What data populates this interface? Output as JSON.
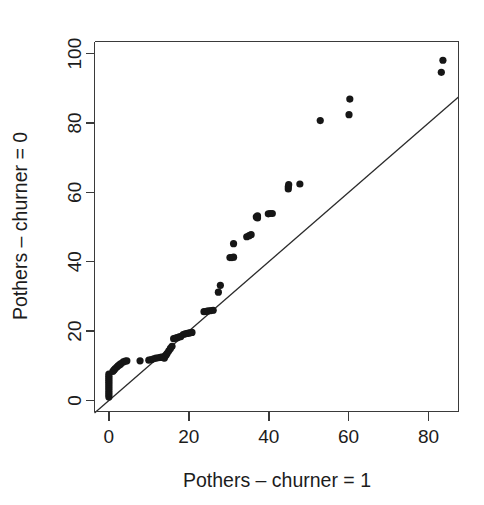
{
  "figure": {
    "kind": "qq-plot",
    "background_color": "#ffffff",
    "foreground_color": "#161616",
    "width": 484,
    "height": 505
  },
  "chart_data": {
    "type": "scatter",
    "title": "",
    "subtitle": "",
    "xlabel": "Pothers – churner = 1",
    "ylabel": "Pothers – churner = 0",
    "xlim": [
      -3.6,
      87.5
    ],
    "ylim": [
      -3.2,
      103.5
    ],
    "xticks": [
      0,
      20,
      40,
      60,
      80
    ],
    "xtick_labels": [
      "0",
      "20",
      "40",
      "60",
      "80"
    ],
    "yticks": [
      0,
      20,
      40,
      60,
      80,
      100
    ],
    "ytick_labels": [
      "0",
      "20",
      "40",
      "60",
      "80",
      "100"
    ],
    "grid": false,
    "legend": null,
    "legend_position": "none",
    "annotations": [],
    "point_color": "#161616",
    "point_radius_px": 3.6,
    "reference_line": {
      "label": "y = x identity line",
      "type": "line",
      "slope": 1,
      "intercept": 0,
      "color": "#2b2b2b",
      "x_start": -3.6,
      "x_end": 87.5
    },
    "series": [
      {
        "name": "quantile pairs",
        "marker": "filled-circle",
        "points": [
          [
            0.0,
            1.0
          ],
          [
            0.0,
            1.6
          ],
          [
            0.0,
            2.2
          ],
          [
            0.0,
            2.8
          ],
          [
            0.0,
            3.4
          ],
          [
            0.0,
            4.0
          ],
          [
            0.0,
            4.6
          ],
          [
            0.0,
            5.2
          ],
          [
            0.0,
            5.8
          ],
          [
            0.0,
            6.4
          ],
          [
            0.0,
            7.0
          ],
          [
            0.0,
            7.6
          ],
          [
            1.0,
            8.4
          ],
          [
            1.3,
            8.8
          ],
          [
            1.6,
            9.2
          ],
          [
            2.0,
            9.6
          ],
          [
            2.3,
            10.0
          ],
          [
            2.7,
            10.3
          ],
          [
            3.0,
            10.6
          ],
          [
            3.6,
            11.1
          ],
          [
            4.1,
            11.3
          ],
          [
            4.5,
            11.4
          ],
          [
            7.8,
            11.4
          ],
          [
            10.0,
            11.6
          ],
          [
            10.6,
            11.8
          ],
          [
            11.2,
            12.0
          ],
          [
            11.8,
            12.2
          ],
          [
            12.4,
            12.3
          ],
          [
            12.9,
            12.4
          ],
          [
            13.3,
            12.5
          ],
          [
            13.6,
            12.3
          ],
          [
            13.9,
            12.2
          ],
          [
            14.3,
            13.0
          ],
          [
            14.6,
            13.6
          ],
          [
            15.0,
            14.3
          ],
          [
            15.4,
            15.0
          ],
          [
            15.8,
            15.6
          ],
          [
            16.2,
            17.8
          ],
          [
            16.7,
            18.0
          ],
          [
            17.1,
            18.1
          ],
          [
            17.6,
            18.3
          ],
          [
            18.0,
            18.4
          ],
          [
            18.6,
            19.0
          ],
          [
            19.1,
            19.2
          ],
          [
            19.5,
            19.3
          ],
          [
            19.9,
            19.4
          ],
          [
            20.3,
            19.5
          ],
          [
            20.8,
            19.6
          ],
          [
            23.8,
            25.6
          ],
          [
            24.4,
            25.7
          ],
          [
            24.9,
            25.8
          ],
          [
            25.6,
            25.9
          ],
          [
            26.1,
            26.0
          ],
          [
            27.4,
            31.2
          ],
          [
            27.9,
            33.2
          ],
          [
            30.3,
            41.2
          ],
          [
            30.8,
            41.2
          ],
          [
            31.2,
            41.3
          ],
          [
            31.2,
            45.2
          ],
          [
            34.5,
            47.2
          ],
          [
            35.1,
            47.5
          ],
          [
            35.6,
            47.8
          ],
          [
            36.9,
            52.9
          ],
          [
            37.2,
            53.2
          ],
          [
            37.2,
            52.6
          ],
          [
            39.9,
            53.8
          ],
          [
            40.4,
            53.9
          ],
          [
            40.9,
            53.9
          ],
          [
            44.9,
            61.0
          ],
          [
            44.9,
            61.6
          ],
          [
            45.0,
            62.2
          ],
          [
            47.8,
            62.4
          ],
          [
            52.9,
            80.7
          ],
          [
            60.1,
            82.4
          ],
          [
            60.3,
            86.9
          ],
          [
            83.2,
            94.6
          ],
          [
            83.6,
            98.1
          ]
        ]
      }
    ]
  },
  "axes": {
    "x_axis_name": "x-axis",
    "y_axis_name": "y-axis",
    "tick_color": "#3a3a3a",
    "axis_color": "#3a3a3a"
  }
}
